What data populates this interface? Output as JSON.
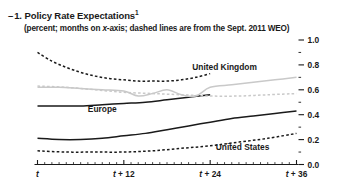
{
  "header": {
    "panel_marker": "–",
    "title": "1. Policy Rate Expectations",
    "title_superscript": "1",
    "subtitle_prefix": "(percent; months on ",
    "subtitle_italic": "x",
    "subtitle_suffix": "-axis; dashed lines are from the Sept. 2011 WEO)"
  },
  "chart_data": {
    "type": "line",
    "title": "1. Policy Rate Expectations",
    "subtitle": "(percent; months on x-axis; dashed lines are from the Sept. 2011 WEO)",
    "xlabel": "",
    "ylabel": "percent",
    "xlim": [
      0,
      36
    ],
    "ylim": [
      0.0,
      1.0
    ],
    "grid": false,
    "legend_position": "inline-annotations",
    "x_ticks": [
      0,
      12,
      24,
      36
    ],
    "x_tick_labels": [
      "t",
      "t + 12",
      "t + 24",
      "t + 36"
    ],
    "x_minor_interval": 1,
    "y_ticks": [
      0.0,
      0.2,
      0.4,
      0.6,
      0.8,
      1.0
    ],
    "y_tick_labels": [
      "0.0",
      "0.2",
      "0.4",
      "0.6",
      "0.8",
      "1.0"
    ],
    "y_minor_ticks": [
      0.1,
      0.3,
      0.5,
      0.7,
      0.9
    ],
    "colors": {
      "dark": "#1a1a1a",
      "light": "#c9c9c9",
      "axis": "#1a1a1a"
    },
    "series": [
      {
        "name": "Europe (Sept. 2011 WEO)",
        "label": "Europe",
        "style": "dashed",
        "color": "#1a1a1a",
        "x": [
          0,
          2,
          4,
          6,
          8,
          10,
          12,
          14,
          16,
          18,
          20,
          22,
          24
        ],
        "values": [
          0.9,
          0.83,
          0.78,
          0.74,
          0.71,
          0.69,
          0.68,
          0.67,
          0.67,
          0.67,
          0.68,
          0.7,
          0.73
        ]
      },
      {
        "name": "Europe (current)",
        "label": "Europe",
        "style": "solid",
        "color": "#1a1a1a",
        "x": [
          0,
          3,
          6,
          9,
          12,
          15,
          18,
          21,
          24
        ],
        "values": [
          0.47,
          0.47,
          0.47,
          0.48,
          0.49,
          0.5,
          0.52,
          0.54,
          0.56
        ]
      },
      {
        "name": "United Kingdom (current)",
        "label": "United Kingdom",
        "style": "solid",
        "color": "#c9c9c9",
        "x": [
          0,
          3,
          6,
          9,
          12,
          14,
          16,
          18,
          20,
          22,
          24,
          27,
          30,
          33,
          36
        ],
        "values": [
          0.62,
          0.62,
          0.61,
          0.6,
          0.59,
          0.55,
          0.57,
          0.6,
          0.56,
          0.55,
          0.62,
          0.64,
          0.66,
          0.68,
          0.7
        ]
      },
      {
        "name": "United Kingdom (Sept. 2011 WEO)",
        "label": "United Kingdom",
        "style": "dashed",
        "color": "#c9c9c9",
        "x": [
          0,
          4,
          8,
          12,
          16,
          20,
          24,
          28,
          32,
          36
        ],
        "values": [
          0.63,
          0.62,
          0.6,
          0.58,
          0.57,
          0.56,
          0.55,
          0.55,
          0.56,
          0.57
        ]
      },
      {
        "name": "United States (current)",
        "label": "United States",
        "style": "solid",
        "color": "#1a1a1a",
        "x": [
          0,
          3,
          6,
          9,
          12,
          15,
          18,
          21,
          24,
          27,
          30,
          33,
          36
        ],
        "values": [
          0.21,
          0.2,
          0.2,
          0.21,
          0.23,
          0.25,
          0.28,
          0.31,
          0.34,
          0.37,
          0.39,
          0.41,
          0.43
        ]
      },
      {
        "name": "United States (Sept. 2011 WEO)",
        "label": "United States",
        "style": "dashed",
        "color": "#1a1a1a",
        "x": [
          0,
          4,
          8,
          12,
          16,
          20,
          24,
          28,
          32,
          36
        ],
        "values": [
          0.11,
          0.1,
          0.1,
          0.1,
          0.11,
          0.13,
          0.15,
          0.18,
          0.21,
          0.25
        ]
      }
    ],
    "annotations": [
      {
        "text": "United Kingdom",
        "x": 26.0,
        "y": 0.76,
        "color": "#1a1a1a"
      },
      {
        "text": "Europe",
        "x": 9.0,
        "y": 0.42,
        "color": "#1a1a1a"
      },
      {
        "text": "United States",
        "x": 28.5,
        "y": 0.12,
        "color": "#1a1a1a"
      }
    ]
  }
}
